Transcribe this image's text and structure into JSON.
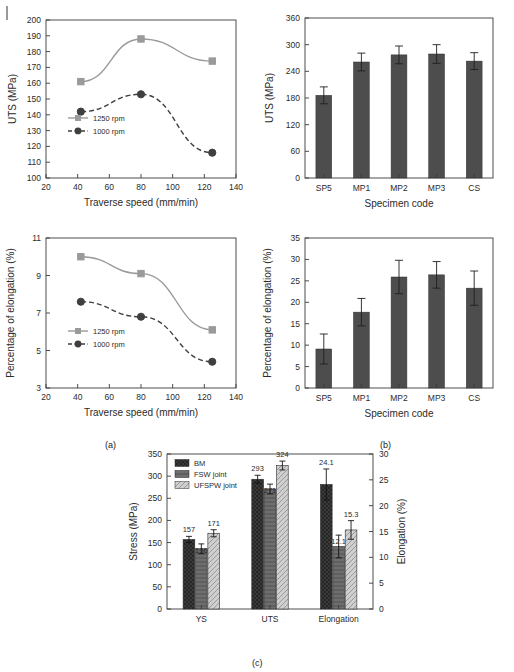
{
  "figure": {
    "captions": [
      {
        "id": "cap-a",
        "text": "(a)"
      },
      {
        "id": "cap-b",
        "text": "(b)"
      },
      {
        "id": "cap-c",
        "text": "(c)"
      }
    ]
  },
  "chart_data": [
    {
      "id": "uts-traverse-line",
      "type": "line",
      "title": "",
      "xlabel": "Traverse speed (mm/min)",
      "ylabel": "UTS (MPa)",
      "xlim": [
        20,
        140
      ],
      "ylim": [
        100,
        200
      ],
      "xticks": [
        20,
        40,
        60,
        80,
        100,
        120,
        140
      ],
      "yticks": [
        100,
        110,
        120,
        130,
        140,
        150,
        160,
        170,
        180,
        190,
        200
      ],
      "grid": false,
      "legend_position": "lower-left",
      "x": [
        42,
        80,
        125
      ],
      "series": [
        {
          "name": "1250 rpm",
          "values": [
            161,
            188,
            174
          ],
          "color": "#9a9a9a",
          "marker": "square",
          "dash": "solid"
        },
        {
          "name": "1000 rpm",
          "values": [
            142,
            153,
            116
          ],
          "color": "#3f3f3f",
          "marker": "circle",
          "dash": "dashed"
        }
      ]
    },
    {
      "id": "uts-specimen-bar",
      "type": "bar",
      "title": "",
      "xlabel": "Specimen code",
      "ylabel": "UTS (MPa)",
      "ylim": [
        0,
        360
      ],
      "yticks": [
        0,
        60,
        120,
        180,
        240,
        300,
        360
      ],
      "grid": false,
      "categories": [
        "SP5",
        "MP1",
        "MP2",
        "MP3",
        "CS"
      ],
      "values": [
        186,
        261,
        277,
        279,
        263
      ],
      "errors": [
        19,
        20,
        20,
        21,
        19
      ],
      "bar_color": "#4d4d4d"
    },
    {
      "id": "elongation-traverse-line",
      "type": "line",
      "title": "",
      "xlabel": "Traverse speed (mm/min)",
      "ylabel": "Percentage of elongation (%)",
      "xlim": [
        20,
        140
      ],
      "ylim": [
        3,
        11
      ],
      "xticks": [
        20,
        40,
        60,
        80,
        100,
        120,
        140
      ],
      "yticks": [
        3,
        5,
        7,
        9,
        11
      ],
      "grid": false,
      "legend_position": "lower-left",
      "x": [
        42,
        80,
        125
      ],
      "series": [
        {
          "name": "1250 rpm",
          "values": [
            10.0,
            9.1,
            6.1
          ],
          "color": "#9a9a9a",
          "marker": "square",
          "dash": "solid"
        },
        {
          "name": "1000 rpm",
          "values": [
            7.6,
            6.8,
            4.4
          ],
          "color": "#3f3f3f",
          "marker": "circle",
          "dash": "dashed"
        }
      ]
    },
    {
      "id": "elongation-specimen-bar",
      "type": "bar",
      "title": "",
      "xlabel": "Specimen code",
      "ylabel": "Percentage of elongation (%)",
      "ylim": [
        0,
        35
      ],
      "yticks": [
        0,
        5,
        10,
        15,
        20,
        25,
        30,
        35
      ],
      "grid": false,
      "categories": [
        "SP5",
        "MP1",
        "MP2",
        "MP3",
        "CS"
      ],
      "values": [
        9.1,
        17.7,
        25.9,
        26.4,
        23.3
      ],
      "errors": [
        3.5,
        3.2,
        3.9,
        3.1,
        4.0
      ],
      "bar_color": "#4d4d4d"
    },
    {
      "id": "joint-properties-grouped-bar",
      "type": "bar",
      "title": "",
      "xlabel": "",
      "ylabel": "Stress (MPa)",
      "y2label": "Elongation (%)",
      "ylim": [
        0,
        350
      ],
      "yticks": [
        0,
        50,
        100,
        150,
        200,
        250,
        300,
        350
      ],
      "y2lim": [
        0,
        30
      ],
      "y2ticks": [
        0,
        5,
        10,
        15,
        20,
        25,
        30
      ],
      "grid": false,
      "legend_position": "upper-left",
      "categories": [
        "YS",
        "UTS",
        "Elongation"
      ],
      "series": [
        {
          "name": "BM",
          "values": [
            157,
            293,
            24.1
          ],
          "labels": [
            "157",
            "293",
            "24.1"
          ],
          "errors": [
            7,
            9,
            3.0
          ],
          "color": "#3a3a3a",
          "hatch": "cross"
        },
        {
          "name": "FSW joint",
          "values": [
            136,
            271,
            12.1
          ],
          "labels": [
            "136",
            "271",
            "12.1"
          ],
          "errors": [
            11,
            11,
            2.2
          ],
          "color": "#6e6e6e",
          "hatch": "dense"
        },
        {
          "name": "UFSPW joint",
          "values": [
            171,
            324,
            15.3
          ],
          "labels": [
            "171",
            "324",
            "15.3"
          ],
          "errors": [
            8,
            10,
            1.8
          ],
          "color": "#cccccc",
          "hatch": "diag"
        }
      ]
    }
  ]
}
